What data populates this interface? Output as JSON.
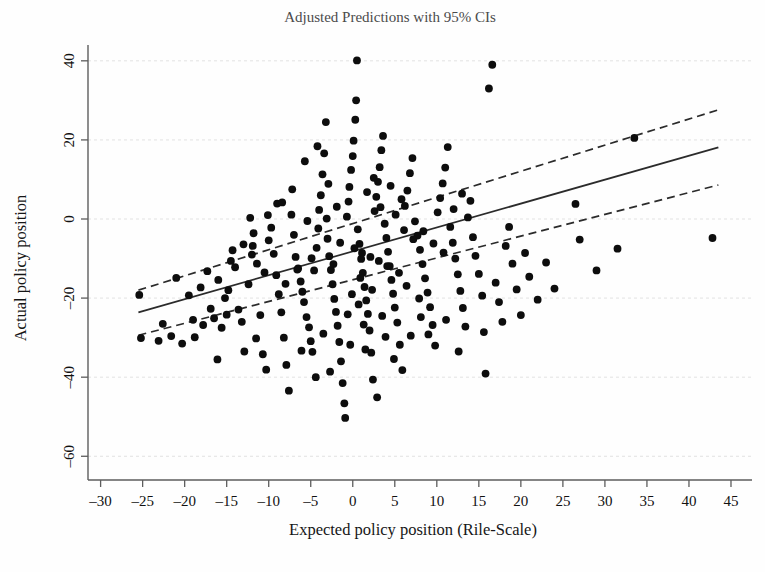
{
  "figure": {
    "title": "Adjusted Predictions with 95% CIs",
    "background_color": "#fefefe",
    "ink_color": "#111111",
    "grid_color": "#e2e2e2"
  },
  "chart_data": {
    "type": "scatter",
    "title": "Adjusted Predictions with 95% CIs",
    "xlabel": "Expected policy position (Rile-Scale)",
    "ylabel": "Actual policy position",
    "xlim": [
      -31.5,
      47.5
    ],
    "ylim": [
      -66,
      44
    ],
    "xticks": [
      -30,
      -25,
      -20,
      -15,
      -10,
      -5,
      0,
      5,
      10,
      15,
      20,
      25,
      30,
      35,
      40,
      45
    ],
    "xticklabels": [
      "–30",
      "–25",
      "–20",
      "–15",
      "–10",
      "–5",
      "0",
      "5",
      "10",
      "15",
      "20",
      "25",
      "30",
      "35",
      "40",
      "45"
    ],
    "yticks": [
      40,
      20,
      0,
      -20,
      -40,
      -60
    ],
    "yticklabels": [
      "40",
      "20",
      "0",
      "–20",
      "–40",
      "–60"
    ],
    "grid": "horizontal-dotted",
    "legend": "none",
    "marker": {
      "shape": "circle",
      "size": 4.6,
      "color": "#0d0d0d"
    },
    "fit_line": {
      "name": "Adjusted prediction (linear fit)",
      "style": "solid",
      "color": "#2b2b2b",
      "x_start": -25.5,
      "y_start": -23.6,
      "x_end": 43.5,
      "y_end": 18.1
    },
    "ci_upper": {
      "name": "95% CI upper bound",
      "style": "dashed",
      "color": "#2b2b2b",
      "x_start": -25.5,
      "y_start": -18.0,
      "x_end": 43.5,
      "y_end": 27.6
    },
    "ci_lower": {
      "name": "95% CI lower bound",
      "style": "dashed",
      "color": "#2b2b2b",
      "x_start": -25.5,
      "y_start": -29.4,
      "x_end": 43.5,
      "y_end": 8.6
    },
    "points": [
      [
        -25.4,
        -19.2
      ],
      [
        -25.2,
        -30.1
      ],
      [
        -23.1,
        -30.8
      ],
      [
        -21.6,
        -29.6
      ],
      [
        -20.3,
        -31.5
      ],
      [
        -19.5,
        -19.3
      ],
      [
        -18.8,
        -29.9
      ],
      [
        -18.1,
        -17.3
      ],
      [
        -17.3,
        -13.2
      ],
      [
        -16.9,
        -22.7
      ],
      [
        -16.5,
        -25.1
      ],
      [
        -16.1,
        -35.5
      ],
      [
        -15.6,
        -27.5
      ],
      [
        -15.2,
        -20.0
      ],
      [
        -14.8,
        -18.0
      ],
      [
        -14.3,
        -7.9
      ],
      [
        -14.0,
        -12.2
      ],
      [
        -13.6,
        -22.9
      ],
      [
        -13.2,
        -26.0
      ],
      [
        -12.9,
        -33.5
      ],
      [
        -12.4,
        -16.5
      ],
      [
        -12.0,
        -9.0
      ],
      [
        -11.8,
        -3.6
      ],
      [
        -11.4,
        -11.3
      ],
      [
        -11.0,
        -24.3
      ],
      [
        -10.7,
        -34.2
      ],
      [
        -10.3,
        -38.1
      ],
      [
        -10.0,
        -5.4
      ],
      [
        -9.7,
        -2.2
      ],
      [
        -9.4,
        -8.8
      ],
      [
        -9.1,
        -14.2
      ],
      [
        -8.8,
        -19.0
      ],
      [
        -8.5,
        -23.6
      ],
      [
        -8.2,
        -30.0
      ],
      [
        -7.9,
        -36.9
      ],
      [
        -7.6,
        -43.4
      ],
      [
        -7.3,
        1.1
      ],
      [
        -7.0,
        -4.0
      ],
      [
        -6.8,
        -9.6
      ],
      [
        -6.5,
        -12.5
      ],
      [
        -6.2,
        -15.8
      ],
      [
        -6.0,
        -18.4
      ],
      [
        -5.8,
        -21.0
      ],
      [
        -5.5,
        -24.8
      ],
      [
        -5.2,
        -27.4
      ],
      [
        -5.0,
        -30.9
      ],
      [
        -4.8,
        -33.6
      ],
      [
        -4.6,
        -13.0
      ],
      [
        -4.3,
        -7.3
      ],
      [
        -4.1,
        -2.4
      ],
      [
        -4.0,
        2.3
      ],
      [
        -3.8,
        6.0
      ],
      [
        -3.6,
        11.3
      ],
      [
        -3.4,
        16.6
      ],
      [
        -3.2,
        24.5
      ],
      [
        -3.0,
        -5.0
      ],
      [
        -2.8,
        -9.4
      ],
      [
        -2.6,
        -12.9
      ],
      [
        -2.4,
        -16.5
      ],
      [
        -2.2,
        -20.2
      ],
      [
        -2.0,
        -23.5
      ],
      [
        -1.8,
        -27.0
      ],
      [
        -1.6,
        -31.1
      ],
      [
        -1.4,
        -36.0
      ],
      [
        -1.2,
        -41.5
      ],
      [
        -1.0,
        -46.6
      ],
      [
        -0.9,
        -50.3
      ],
      [
        -0.7,
        0.6
      ],
      [
        -0.5,
        4.4
      ],
      [
        -0.4,
        8.1
      ],
      [
        -0.2,
        12.4
      ],
      [
        0.0,
        15.9
      ],
      [
        0.1,
        19.8
      ],
      [
        0.3,
        25.1
      ],
      [
        0.5,
        40.1
      ],
      [
        0.6,
        -2.6
      ],
      [
        0.8,
        -6.3
      ],
      [
        1.0,
        -10.1
      ],
      [
        1.2,
        -13.6
      ],
      [
        1.4,
        -17.2
      ],
      [
        1.6,
        -20.6
      ],
      [
        1.8,
        -24.0
      ],
      [
        2.0,
        -28.2
      ],
      [
        2.2,
        -33.8
      ],
      [
        2.4,
        -40.6
      ],
      [
        2.6,
        2.0
      ],
      [
        2.8,
        5.6
      ],
      [
        3.0,
        9.4
      ],
      [
        3.2,
        13.1
      ],
      [
        3.4,
        17.4
      ],
      [
        3.6,
        21.0
      ],
      [
        3.8,
        -1.2
      ],
      [
        4.0,
        -4.8
      ],
      [
        4.2,
        -8.3
      ],
      [
        4.4,
        -11.9
      ],
      [
        4.6,
        -15.4
      ],
      [
        4.8,
        -18.9
      ],
      [
        5.0,
        -22.4
      ],
      [
        5.3,
        -26.2
      ],
      [
        5.6,
        -31.8
      ],
      [
        5.9,
        -38.2
      ],
      [
        6.2,
        3.3
      ],
      [
        6.5,
        7.2
      ],
      [
        6.8,
        11.6
      ],
      [
        7.1,
        15.4
      ],
      [
        7.4,
        -0.6
      ],
      [
        7.7,
        -4.2
      ],
      [
        8.0,
        -7.8
      ],
      [
        8.3,
        -11.4
      ],
      [
        8.6,
        -15.0
      ],
      [
        8.9,
        -18.6
      ],
      [
        9.2,
        -22.3
      ],
      [
        9.5,
        -26.8
      ],
      [
        9.8,
        -32.0
      ],
      [
        10.1,
        1.7
      ],
      [
        10.4,
        5.3
      ],
      [
        10.7,
        9.0
      ],
      [
        11.0,
        13.0
      ],
      [
        11.3,
        18.2
      ],
      [
        11.6,
        -2.0
      ],
      [
        11.9,
        -6.0
      ],
      [
        12.2,
        -10.0
      ],
      [
        12.5,
        -14.0
      ],
      [
        12.8,
        -18.2
      ],
      [
        13.1,
        -22.5
      ],
      [
        13.4,
        -27.2
      ],
      [
        13.7,
        0.4
      ],
      [
        14.0,
        4.6
      ],
      [
        14.3,
        -4.6
      ],
      [
        14.6,
        -9.3
      ],
      [
        15.0,
        -13.9
      ],
      [
        15.4,
        -19.4
      ],
      [
        15.6,
        -28.6
      ],
      [
        15.8,
        -39.1
      ],
      [
        16.2,
        33.0
      ],
      [
        16.6,
        39.0
      ],
      [
        17.0,
        -16.1
      ],
      [
        17.4,
        -21.0
      ],
      [
        17.8,
        -26.0
      ],
      [
        18.2,
        -6.8
      ],
      [
        18.6,
        -2.0
      ],
      [
        19.0,
        -11.3
      ],
      [
        19.5,
        -17.8
      ],
      [
        20.0,
        -24.3
      ],
      [
        20.5,
        -8.6
      ],
      [
        21.0,
        -14.6
      ],
      [
        22.0,
        -20.4
      ],
      [
        23.0,
        -11.0
      ],
      [
        24.0,
        -17.6
      ],
      [
        26.5,
        3.8
      ],
      [
        27.0,
        -5.2
      ],
      [
        29.0,
        -13.0
      ],
      [
        31.5,
        -7.5
      ],
      [
        33.5,
        20.5
      ],
      [
        42.8,
        -4.8
      ],
      [
        -12.2,
        0.3
      ],
      [
        -9.0,
        3.9
      ],
      [
        -7.2,
        7.5
      ],
      [
        -5.4,
        -0.5
      ],
      [
        -3.1,
        0.1
      ],
      [
        -1.5,
        -6.0
      ],
      [
        0.2,
        -7.4
      ],
      [
        1.1,
        -8.6
      ],
      [
        2.1,
        -9.6
      ],
      [
        3.1,
        -10.6
      ],
      [
        4.1,
        -11.9
      ],
      [
        5.1,
        1.1
      ],
      [
        6.1,
        -2.8
      ],
      [
        7.2,
        -5.1
      ],
      [
        8.4,
        -3.1
      ],
      [
        9.6,
        -6.2
      ],
      [
        10.8,
        -8.5
      ],
      [
        12.0,
        2.5
      ],
      [
        13.0,
        6.4
      ],
      [
        0.9,
        -14.9
      ],
      [
        -2.3,
        -11.4
      ],
      [
        -4.9,
        -9.9
      ],
      [
        -6.6,
        -12.8
      ],
      [
        -8.0,
        -16.4
      ],
      [
        -10.5,
        -13.5
      ],
      [
        -13.0,
        -6.4
      ],
      [
        -15.0,
        -24.2
      ],
      [
        -17.8,
        -26.8
      ],
      [
        2.9,
        -45.1
      ],
      [
        -0.3,
        -31.8
      ],
      [
        4.9,
        -35.4
      ],
      [
        6.9,
        -29.5
      ],
      [
        1.5,
        -33.0
      ],
      [
        -3.5,
        -29.0
      ],
      [
        -6.1,
        -33.3
      ],
      [
        -11.5,
        -30.2
      ],
      [
        3.5,
        -24.5
      ],
      [
        -2.7,
        -38.6
      ],
      [
        -4.4,
        -40.0
      ],
      [
        -0.6,
        -24.1
      ],
      [
        8.1,
        -24.8
      ],
      [
        9.0,
        -29.2
      ],
      [
        11.1,
        -25.5
      ],
      [
        12.6,
        -33.5
      ],
      [
        5.5,
        -13.6
      ],
      [
        6.4,
        -16.9
      ],
      [
        7.9,
        -20.1
      ],
      [
        -8.4,
        4.2
      ],
      [
        -10.1,
        1.0
      ],
      [
        -11.9,
        -6.8
      ],
      [
        -14.5,
        -10.6
      ],
      [
        -16.0,
        -15.4
      ],
      [
        -19.0,
        -25.5
      ],
      [
        -21.0,
        -14.9
      ],
      [
        -22.6,
        -26.5
      ],
      [
        1.7,
        6.8
      ],
      [
        2.5,
        10.4
      ],
      [
        3.3,
        3.0
      ],
      [
        4.5,
        8.4
      ],
      [
        5.8,
        5.0
      ],
      [
        -1.9,
        3.1
      ],
      [
        -2.9,
        8.9
      ],
      [
        -5.7,
        14.6
      ],
      [
        -4.2,
        18.4
      ],
      [
        0.4,
        30.0
      ],
      [
        -0.1,
        -19.0
      ],
      [
        0.7,
        -21.6
      ],
      [
        1.3,
        -26.7
      ],
      [
        2.3,
        -17.9
      ],
      [
        3.9,
        -29.8
      ]
    ]
  },
  "axes": {
    "title_label": "Adjusted Predictions with 95% CIs",
    "x_axis_label": "Expected policy position (Rile-Scale)",
    "y_axis_label": "Actual policy position"
  }
}
